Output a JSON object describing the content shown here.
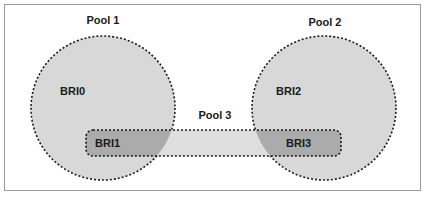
{
  "diagram": {
    "pools": [
      {
        "id": "pool1",
        "label": "Pool 1"
      },
      {
        "id": "pool2",
        "label": "Pool 2"
      },
      {
        "id": "pool3",
        "label": "Pool 3"
      }
    ],
    "nodes": [
      {
        "id": "bri0",
        "label": "BRI0",
        "pool": "Pool 1"
      },
      {
        "id": "bri1",
        "label": "BRI1",
        "pool": "Pool 1, Pool 3"
      },
      {
        "id": "bri2",
        "label": "BRI2",
        "pool": "Pool 2"
      },
      {
        "id": "bri3",
        "label": "BRI3",
        "pool": "Pool 2, Pool 3"
      }
    ],
    "colors": {
      "pool_fill": "#d6d6d6",
      "overlap_fill": "#a8a8a8",
      "border": "#1a1a1a",
      "frame": "#9a9a9a"
    }
  }
}
